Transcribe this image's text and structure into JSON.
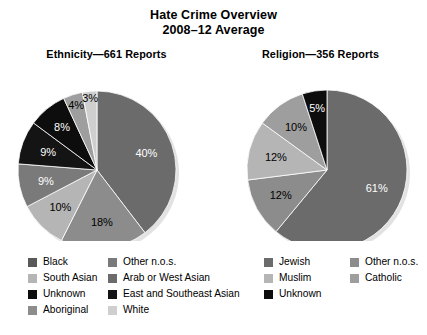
{
  "title": {
    "line1": "Hate Crime Overview",
    "line2": "2008–12 Average"
  },
  "panels": {
    "ethnicity": {
      "subtitle": "Ethnicity—661 Reports",
      "legend": [
        {
          "label": "Black",
          "color": "#595959"
        },
        {
          "label": "South Asian",
          "color": "#b5b5b5"
        },
        {
          "label": "Unknown",
          "color": "#0d0d0d"
        },
        {
          "label": "Aboriginal",
          "color": "#8c8c8c"
        },
        {
          "label": "Other n.o.s.",
          "color": "#7a7a7a"
        },
        {
          "label": "Arab or West Asian",
          "color": "#6b6b6b"
        },
        {
          "label": "East and Southeast Asian",
          "color": "#141414"
        },
        {
          "label": "White",
          "color": "#cfcfcf"
        }
      ]
    },
    "religion": {
      "subtitle": "Religion—356 Reports",
      "legend": [
        {
          "label": "Jewish",
          "color": "#6b6b6b"
        },
        {
          "label": "Muslim",
          "color": "#b5b5b5"
        },
        {
          "label": "Unknown",
          "color": "#0d0d0d"
        },
        {
          "label": "Other n.o.s.",
          "color": "#8c8c8c"
        },
        {
          "label": "Catholic",
          "color": "#9e9e9e"
        }
      ]
    }
  },
  "chart_data": [
    {
      "type": "pie",
      "title": "Ethnicity—661 Reports",
      "total_reports": 661,
      "unit": "%",
      "start_angle_deg": 0,
      "direction": "clockwise",
      "legend_position": "bottom",
      "categories": [
        "Black",
        "South Asian",
        "Aboriginal",
        "Arab or West Asian",
        "East and Southeast Asian",
        "Other n.o.s.",
        "White",
        "Unknown"
      ],
      "values": [
        40,
        18,
        10,
        9,
        9,
        8,
        4,
        3
      ],
      "labels": [
        "40%",
        "18%",
        "10%",
        "9%",
        "9%",
        "8%",
        "4%",
        "3%"
      ],
      "colors": [
        "#6b6b6b",
        "#8c8c8c",
        "#b5b5b5",
        "#7a7a7a",
        "#141414",
        "#0d0d0d",
        "#9e9e9e",
        "#cfcfcf"
      ]
    },
    {
      "type": "pie",
      "title": "Religion—356 Reports",
      "total_reports": 356,
      "unit": "%",
      "start_angle_deg": 0,
      "direction": "clockwise",
      "legend_position": "bottom",
      "categories": [
        "Jewish",
        "Muslim",
        "Catholic",
        "Other n.o.s.",
        "Unknown"
      ],
      "values": [
        61,
        12,
        12,
        10,
        5
      ],
      "labels": [
        "61%",
        "12%",
        "12%",
        "10%",
        "5%"
      ],
      "colors": [
        "#6b6b6b",
        "#8c8c8c",
        "#b5b5b5",
        "#9e9e9e",
        "#0d0d0d"
      ]
    }
  ]
}
